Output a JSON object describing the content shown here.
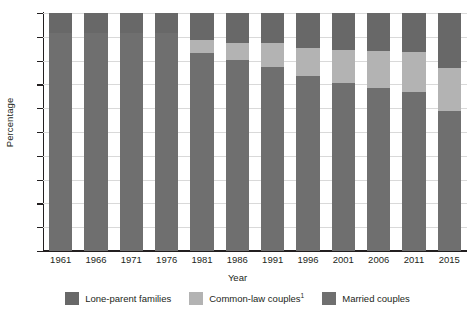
{
  "chart_data": {
    "type": "bar",
    "subtype": "stacked-100-percent",
    "title": "",
    "xlabel": "Year",
    "ylabel": "Percentage",
    "ylim": [
      0,
      100
    ],
    "ytick_step": 10,
    "yticks": [
      0,
      10,
      20,
      30,
      40,
      50,
      60,
      70,
      80,
      90,
      100
    ],
    "grid": true,
    "grid_axis": "y",
    "legend_position": "bottom",
    "categories": [
      "1961",
      "1966",
      "1971",
      "1976",
      "1981",
      "1986",
      "1991",
      "1996",
      "2001",
      "2006",
      "2011",
      "2015"
    ],
    "stack_order_bottom_to_top": [
      "Married couples",
      "Common-law couples",
      "Lone-parent families"
    ],
    "series": [
      {
        "name": "Married couples",
        "color": "#6f6f6f",
        "values": [
          91.6,
          91.6,
          91.6,
          91.6,
          83.1,
          80.2,
          77.2,
          73.7,
          70.5,
          68.6,
          67.0,
          59.0
        ]
      },
      {
        "name": "Common-law couples",
        "color": "#b3b3b3",
        "values": [
          0.0,
          0.0,
          0.0,
          0.0,
          5.6,
          7.2,
          10.0,
          11.7,
          13.8,
          15.5,
          16.7,
          18.1
        ]
      },
      {
        "name": "Lone-parent families",
        "color": "#686868",
        "values": [
          8.4,
          8.4,
          8.4,
          8.4,
          11.3,
          12.6,
          12.8,
          14.6,
          15.7,
          15.9,
          16.3,
          22.9
        ]
      }
    ]
  },
  "axes": {
    "ylabel": "Percentage",
    "xlabel": "Year"
  },
  "legend": {
    "items": [
      {
        "label": "Lone-parent families",
        "superscript": "",
        "color": "#686868"
      },
      {
        "label": "Common-law couples",
        "superscript": "1",
        "color": "#b3b3b3"
      },
      {
        "label": "Married couples",
        "superscript": "",
        "color": "#6f6f6f"
      }
    ]
  }
}
